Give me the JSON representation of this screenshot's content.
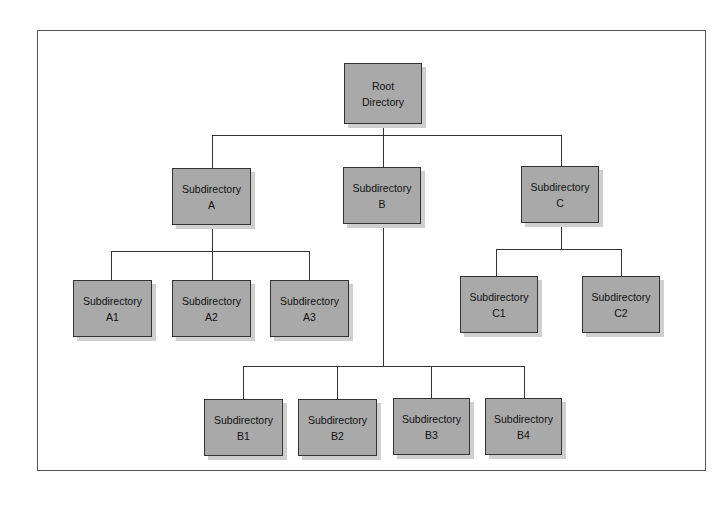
{
  "diagram": {
    "type": "directory-tree",
    "colors": {
      "node_fill": "#a9a9a9",
      "node_border": "#333333",
      "line": "#333333",
      "frame": "#555555"
    },
    "root": {
      "line1": "Root",
      "line2": "Directory"
    },
    "level1": [
      {
        "id": "A",
        "line1": "Subdirectory",
        "line2": "A"
      },
      {
        "id": "B",
        "line1": "Subdirectory",
        "line2": "B"
      },
      {
        "id": "C",
        "line1": "Subdirectory",
        "line2": "C"
      }
    ],
    "children_a": [
      {
        "id": "A1",
        "line1": "Subdirectory",
        "line2": "A1"
      },
      {
        "id": "A2",
        "line1": "Subdirectory",
        "line2": "A2"
      },
      {
        "id": "A3",
        "line1": "Subdirectory",
        "line2": "A3"
      }
    ],
    "children_b": [
      {
        "id": "B1",
        "line1": "Subdirectory",
        "line2": "B1"
      },
      {
        "id": "B2",
        "line1": "Subdirectory",
        "line2": "B2"
      },
      {
        "id": "B3",
        "line1": "Subdirectory",
        "line2": "B3"
      },
      {
        "id": "B4",
        "line1": "Subdirectory",
        "line2": "B4"
      }
    ],
    "children_c": [
      {
        "id": "C1",
        "line1": "Subdirectory",
        "line2": "C1"
      },
      {
        "id": "C2",
        "line1": "Subdirectory",
        "line2": "C2"
      }
    ]
  }
}
